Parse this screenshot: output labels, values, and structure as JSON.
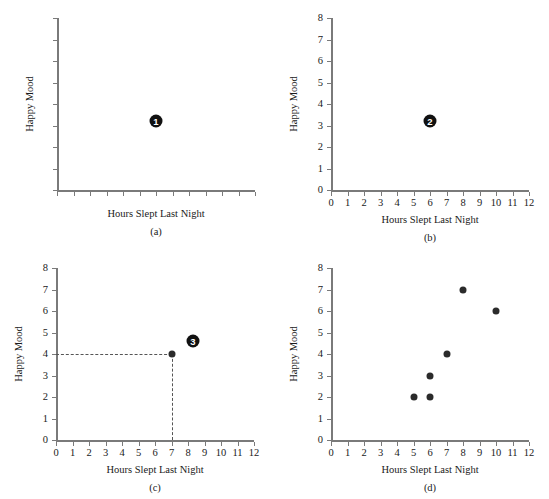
{
  "figure": {
    "background": "#ffffff",
    "axis_color": "#7a7a7a",
    "point_color": "#2b2b2b",
    "badge_color": "#111111",
    "guide_color": "#555555"
  },
  "axis_titles": {
    "x": "Hours Slept Last Night",
    "y": "Happy Mood"
  },
  "captions": {
    "a": "(a)",
    "b": "(b)",
    "c": "(c)",
    "d": "(d)"
  },
  "x_tick_labels": [
    "0",
    "1",
    "2",
    "3",
    "4",
    "5",
    "6",
    "7",
    "8",
    "9",
    "10",
    "11",
    "12"
  ],
  "y_tick_labels": [
    "0",
    "1",
    "2",
    "3",
    "4",
    "5",
    "6",
    "7",
    "8"
  ],
  "badges": {
    "one": "1",
    "two": "2",
    "three": "3"
  },
  "chart_data": [
    {
      "id": "a",
      "type": "scatter",
      "title": "(a)",
      "xlabel": "Hours Slept Last Night",
      "ylabel": "Happy Mood",
      "xlim": [
        0,
        12
      ],
      "ylim": [
        0,
        8
      ],
      "xticks": [
        0,
        1,
        2,
        3,
        4,
        5,
        6,
        7,
        8,
        9,
        10,
        11,
        12
      ],
      "yticks": [
        0,
        1,
        2,
        3,
        4,
        5,
        6,
        7,
        8
      ],
      "tick_labels_shown": false,
      "grid": false,
      "legend": "none",
      "x": [],
      "y": [],
      "annotations": [
        {
          "label": "1",
          "x": 6.0,
          "y": 3.2,
          "style": "filled-circle-number"
        }
      ]
    },
    {
      "id": "b",
      "type": "scatter",
      "title": "(b)",
      "xlabel": "Hours Slept Last Night",
      "ylabel": "Happy Mood",
      "xlim": [
        0,
        12
      ],
      "ylim": [
        0,
        8
      ],
      "xticks": [
        0,
        1,
        2,
        3,
        4,
        5,
        6,
        7,
        8,
        9,
        10,
        11,
        12
      ],
      "yticks": [
        0,
        1,
        2,
        3,
        4,
        5,
        6,
        7,
        8
      ],
      "tick_labels_shown": true,
      "grid": false,
      "legend": "none",
      "x": [],
      "y": [],
      "annotations": [
        {
          "label": "2",
          "x": 6.0,
          "y": 3.2,
          "style": "filled-circle-number"
        }
      ]
    },
    {
      "id": "c",
      "type": "scatter",
      "title": "(c)",
      "xlabel": "Hours Slept Last Night",
      "ylabel": "Happy Mood",
      "xlim": [
        0,
        12
      ],
      "ylim": [
        0,
        8
      ],
      "xticks": [
        0,
        1,
        2,
        3,
        4,
        5,
        6,
        7,
        8,
        9,
        10,
        11,
        12
      ],
      "yticks": [
        0,
        1,
        2,
        3,
        4,
        5,
        6,
        7,
        8
      ],
      "tick_labels_shown": true,
      "grid": false,
      "legend": "none",
      "x": [
        7
      ],
      "y": [
        4
      ],
      "guides": [
        {
          "type": "horizontal",
          "y": 4,
          "from_x": 0,
          "to_x": 7,
          "dashed": true
        },
        {
          "type": "vertical",
          "x": 7,
          "from_y": 0,
          "to_y": 4,
          "dashed": true
        }
      ],
      "annotations": [
        {
          "label": "3",
          "x": 8.3,
          "y": 4.6,
          "style": "filled-circle-number"
        }
      ]
    },
    {
      "id": "d",
      "type": "scatter",
      "title": "(d)",
      "xlabel": "Hours Slept Last Night",
      "ylabel": "Happy Mood",
      "xlim": [
        0,
        12
      ],
      "ylim": [
        0,
        8
      ],
      "xticks": [
        0,
        1,
        2,
        3,
        4,
        5,
        6,
        7,
        8,
        9,
        10,
        11,
        12
      ],
      "yticks": [
        0,
        1,
        2,
        3,
        4,
        5,
        6,
        7,
        8
      ],
      "tick_labels_shown": true,
      "grid": false,
      "legend": "none",
      "x": [
        5,
        6,
        6,
        7,
        8,
        10
      ],
      "y": [
        2,
        2,
        3,
        4,
        7,
        6
      ],
      "annotations": []
    }
  ]
}
